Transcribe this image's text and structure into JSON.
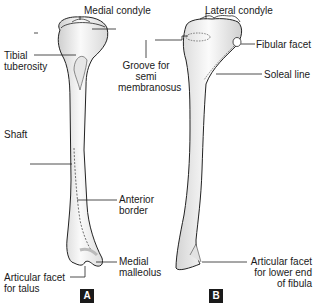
{
  "figure": {
    "panels": [
      {
        "id": "A",
        "badge": "A",
        "view": "anterior",
        "labels": {
          "medial_condyle": "Medial condyle",
          "tibial_tuberosity_1": "Tibial",
          "tibial_tuberosity_2": "tuberosity",
          "shaft": "Shaft",
          "anterior_border_1": "Anterior",
          "anterior_border_2": "border",
          "medial_malleolus_1": "Medial",
          "medial_malleolus_2": "malleolus",
          "articular_facet_talus_1": "Articular facet",
          "articular_facet_talus_2": "for talus"
        }
      },
      {
        "id": "B",
        "badge": "B",
        "view": "posterior",
        "labels": {
          "lateral_condyle": "Lateral condyle",
          "fibular_facet": "Fibular facet",
          "groove_1": "Groove for",
          "groove_2": "semi",
          "groove_3": "membranosus",
          "soleal_line": "Soleal line",
          "articular_facet_fibula_1": "Articular facet",
          "articular_facet_fibula_2": "for lower end",
          "articular_facet_fibula_3": "of fibula"
        }
      }
    ],
    "colors": {
      "outline": "#222222",
      "bone_fill": "#f2f2f2",
      "bone_shade": "#cfcfcf",
      "badge_bg": "#1a1a1a"
    }
  }
}
